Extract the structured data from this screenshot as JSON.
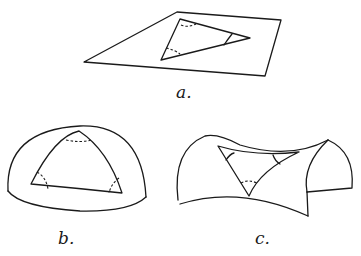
{
  "figures": [
    {
      "id": "a",
      "label": "a.",
      "surface": "flat plane",
      "description": "Triangle on a flat plane"
    },
    {
      "id": "b",
      "label": "b.",
      "surface": "sphere",
      "description": "Triangle on a spherical surface"
    },
    {
      "id": "c",
      "label": "c.",
      "surface": "saddle",
      "description": "Triangle on a saddle-shaped (hyperbolic) surface"
    }
  ],
  "colors": {
    "ink": "#1a1a1a",
    "background": "#ffffff"
  }
}
